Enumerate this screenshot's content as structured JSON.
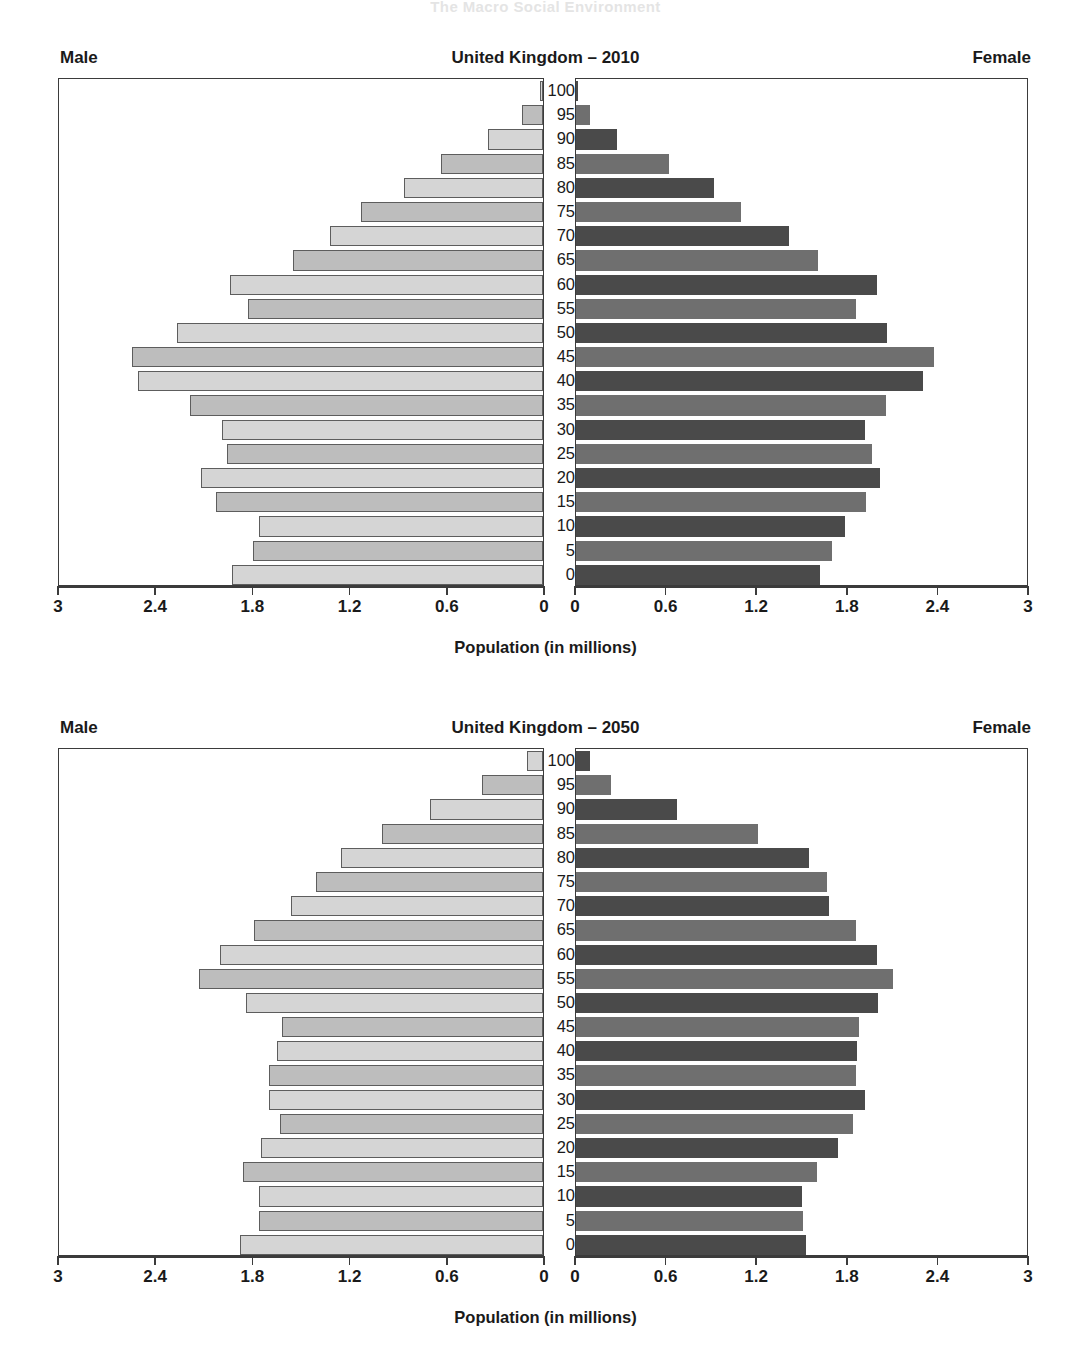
{
  "page_header": "The Macro Social Environment",
  "axis": {
    "x_title": "Population (in millions)",
    "male_ticks": [
      "3",
      "2.4",
      "1.8",
      "1.2",
      "0.6",
      "0"
    ],
    "female_ticks": [
      "0",
      "0.6",
      "1.2",
      "1.8",
      "2.4",
      "3"
    ],
    "tick_values": [
      0,
      0.6,
      1.2,
      1.8,
      2.4,
      3
    ],
    "max": 3,
    "age_labels": [
      "100",
      "95",
      "90",
      "85",
      "80",
      "75",
      "70",
      "65",
      "60",
      "55",
      "50",
      "45",
      "40",
      "35",
      "30",
      "25",
      "20",
      "15",
      "10",
      "5",
      "0"
    ]
  },
  "labels": {
    "male": "Male",
    "female": "Female"
  },
  "colors": {
    "male_light": "#d5d5d5",
    "male_mid": "#bdbdbd",
    "female_dark": "#4a4a4a",
    "female_mid": "#6f6f6f",
    "axis": "#3b3b3b"
  },
  "charts": [
    {
      "id": "uk-2010",
      "title": "United Kingdom – 2010"
    },
    {
      "id": "uk-2050",
      "title": "United Kingdom – 2050"
    }
  ],
  "chart_data": [
    {
      "type": "bar",
      "title": "United Kingdom – 2010",
      "subtype": "population-pyramid",
      "xlabel": "Population (in millions)",
      "ylabel": "Age",
      "xlim": [
        0,
        3
      ],
      "grid": false,
      "categories": [
        "0",
        "5",
        "10",
        "15",
        "20",
        "25",
        "30",
        "35",
        "40",
        "45",
        "50",
        "55",
        "60",
        "65",
        "70",
        "75",
        "80",
        "85",
        "90",
        "95",
        "100"
      ],
      "series": [
        {
          "name": "Male",
          "values": [
            1.93,
            1.8,
            1.76,
            2.03,
            2.12,
            1.96,
            1.99,
            2.19,
            2.51,
            2.55,
            2.27,
            1.83,
            1.94,
            1.55,
            1.32,
            1.13,
            0.86,
            0.63,
            0.34,
            0.13,
            0.02
          ]
        },
        {
          "name": "Female",
          "values": [
            1.62,
            1.7,
            1.79,
            1.93,
            2.02,
            1.97,
            1.92,
            2.06,
            2.31,
            2.38,
            2.07,
            1.86,
            2.0,
            1.61,
            1.42,
            1.1,
            0.92,
            0.62,
            0.27,
            0.09,
            0.01
          ]
        }
      ],
      "legend": [
        "Male",
        "Female"
      ],
      "legend_position": "top-left/top-right"
    },
    {
      "type": "bar",
      "title": "United Kingdom – 2050",
      "subtype": "population-pyramid",
      "xlabel": "Population (in millions)",
      "ylabel": "Age",
      "xlim": [
        0,
        3
      ],
      "grid": false,
      "categories": [
        "0",
        "5",
        "10",
        "15",
        "20",
        "25",
        "30",
        "35",
        "40",
        "45",
        "50",
        "55",
        "60",
        "65",
        "70",
        "75",
        "80",
        "85",
        "90",
        "95",
        "100"
      ],
      "series": [
        {
          "name": "Male",
          "values": [
            1.88,
            1.76,
            1.76,
            1.86,
            1.75,
            1.63,
            1.7,
            1.7,
            1.65,
            1.62,
            1.84,
            2.13,
            2.0,
            1.79,
            1.56,
            1.41,
            1.25,
            1.0,
            0.7,
            0.38,
            0.1
          ]
        },
        {
          "name": "Female",
          "values": [
            1.53,
            1.51,
            1.5,
            1.6,
            1.74,
            1.84,
            1.92,
            1.86,
            1.87,
            1.88,
            2.01,
            2.11,
            2.0,
            1.86,
            1.68,
            1.67,
            1.55,
            1.21,
            0.67,
            0.23,
            0.09
          ]
        }
      ],
      "legend": [
        "Male",
        "Female"
      ],
      "legend_position": "top-left/top-right"
    }
  ]
}
